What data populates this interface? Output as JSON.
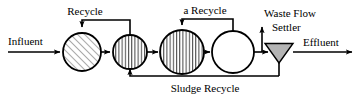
{
  "diagram": {
    "type": "process-flow",
    "colors": {
      "line": "#000000",
      "settler_fill": "#b4b4b4",
      "reactor_fill": "#ffffff",
      "hatch": "#4a4a4a",
      "background": "#ffffff"
    },
    "labels": {
      "influent": "Influent",
      "recycle": "Recycle",
      "a_recycle": "a Recycle",
      "waste_flow": "Waste Flow",
      "settler": "Settler",
      "effluent": "Effluent",
      "sludge_recycle": "Sludge Recycle"
    },
    "units": [
      {
        "id": "reactor-1",
        "name": "reactor-1",
        "fill_pattern": "diagonal-hatch",
        "cx": 82,
        "cy": 52,
        "r": 19
      },
      {
        "id": "reactor-2",
        "name": "reactor-2",
        "fill_pattern": "vertical-hatch",
        "cx": 130,
        "cy": 52,
        "r": 17
      },
      {
        "id": "reactor-3",
        "name": "reactor-3",
        "fill_pattern": "vertical-hatch",
        "cx": 182,
        "cy": 52,
        "r": 22
      },
      {
        "id": "reactor-4",
        "name": "reactor-4",
        "fill_pattern": "none",
        "cx": 233,
        "cy": 52,
        "r": 21
      },
      {
        "id": "settler",
        "name": "settler-clarifier",
        "fill_pattern": "solid-gray",
        "shape": "triangle-down"
      }
    ],
    "streams": [
      {
        "name": "influent-stream",
        "label": "Influent",
        "direction": "right"
      },
      {
        "name": "recycle-stream",
        "label": "Recycle",
        "direction": "left-loop"
      },
      {
        "name": "a-recycle-stream",
        "label": "a Recycle",
        "direction": "left-loop"
      },
      {
        "name": "waste-flow-stream",
        "label": "Waste Flow",
        "direction": "up"
      },
      {
        "name": "effluent-stream",
        "label": "Effluent",
        "direction": "right"
      },
      {
        "name": "sludge-recycle-stream",
        "label": "Sludge Recycle",
        "direction": "left-loop"
      }
    ]
  }
}
